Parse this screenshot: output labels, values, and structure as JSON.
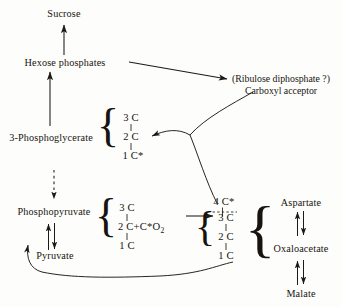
{
  "diagram": {
    "nodes": {
      "sucrose": "Sucrose",
      "hexose_phosphates": "Hexose  phosphates",
      "phosphoglycerate": "3-Phosphoglycerate",
      "phosphopyruvate": "Phosphopyruvate",
      "pyruvate": "Pyruvate",
      "acceptor_line1": "(Ribulose diphosphate ?)",
      "acceptor_line2": "Carboxyl acceptor",
      "aspartate": "Aspartate",
      "oxaloacetate": "Oxaloacetate",
      "malate": "Malate"
    },
    "carbon_groups": {
      "pga": {
        "c3": "3 C",
        "c2": "2 C",
        "c1": "1 C*"
      },
      "pyruvate_group": {
        "c3": "3 C",
        "c2": "2 C+C*O",
        "c2_sub": "2",
        "c1": "1 C"
      },
      "c4_top": "4 C*",
      "oaa_group": {
        "c3": "3 C",
        "c2": "2 C",
        "c1": "1 C"
      }
    },
    "brace": "}",
    "brace_left": "{",
    "colors": {
      "ink": "#17140f",
      "line": "#1d1a15",
      "background": "#fdfdfb"
    }
  }
}
